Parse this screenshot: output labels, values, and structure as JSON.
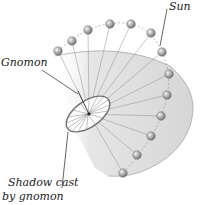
{
  "figure": {
    "labels": {
      "sun": "Sun",
      "gnomon": "Gnomon",
      "shadow_line1": "Shadow cast",
      "shadow_line2": "by gnomon"
    },
    "colors": {
      "plane_fill": "#dcdcdc",
      "plane_edge": "#9a9a9a",
      "sun_fill": "#9e9e9e",
      "sun_highlight": "#f2f2f2",
      "ray": "#8a8a8a",
      "disc_edge": "#6f6f6f",
      "text": "#222222"
    },
    "sun_positions": [
      [
        58,
        51
      ],
      [
        72,
        41
      ],
      [
        88,
        30
      ],
      [
        110,
        24
      ],
      [
        131,
        24
      ],
      [
        151,
        33
      ],
      [
        162,
        52
      ],
      [
        169,
        74
      ],
      [
        167,
        95
      ],
      [
        161,
        116
      ],
      [
        151,
        136
      ],
      [
        137,
        155
      ],
      [
        123,
        173
      ]
    ]
  }
}
